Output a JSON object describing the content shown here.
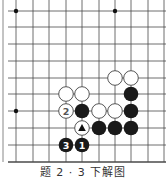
{
  "diagram": {
    "type": "go-board-fragment",
    "caption": "题 2 · 3 下解图",
    "grid": {
      "columns_x": [
        16,
        33,
        49,
        66,
        82,
        99,
        115,
        131,
        148,
        164
      ],
      "rows_y": [
        11,
        27,
        44,
        61,
        78,
        94,
        111,
        128,
        145,
        162
      ],
      "left_border_x": 3,
      "bottom_edge": true,
      "line_color": "#4a4a4a"
    },
    "star_points": [
      {
        "col": 0,
        "row": 0
      },
      {
        "col": 6,
        "row": 0
      },
      {
        "col": 0,
        "row": 6
      }
    ],
    "stones": [
      {
        "color": "white",
        "col": 6,
        "row": 4,
        "label": ""
      },
      {
        "color": "white",
        "col": 7,
        "row": 4,
        "label": ""
      },
      {
        "color": "white",
        "col": 3,
        "row": 5,
        "label": ""
      },
      {
        "color": "white",
        "col": 4,
        "row": 5,
        "label": ""
      },
      {
        "color": "black",
        "col": 7,
        "row": 5,
        "label": ""
      },
      {
        "color": "white",
        "col": 3,
        "row": 6,
        "label": "2"
      },
      {
        "color": "black",
        "col": 4,
        "row": 6,
        "label": ""
      },
      {
        "color": "white",
        "col": 5,
        "row": 6,
        "label": ""
      },
      {
        "color": "white",
        "col": 6,
        "row": 6,
        "label": ""
      },
      {
        "color": "black",
        "col": 7,
        "row": 6,
        "label": ""
      },
      {
        "color": "white",
        "col": 4,
        "row": 7,
        "label": "",
        "marker": "triangle"
      },
      {
        "color": "black",
        "col": 5,
        "row": 7,
        "label": ""
      },
      {
        "color": "black",
        "col": 6,
        "row": 7,
        "label": ""
      },
      {
        "color": "black",
        "col": 7,
        "row": 7,
        "label": ""
      },
      {
        "color": "black",
        "col": 3,
        "row": 8,
        "label": "3"
      },
      {
        "color": "black",
        "col": 4,
        "row": 8,
        "label": "1"
      }
    ],
    "colors": {
      "black_stone": "#1a1a1a",
      "white_stone_fill": "#ffffff",
      "white_stone_stroke": "#555555",
      "label_on_black": "#ffffff",
      "label_on_white": "#555555"
    }
  }
}
